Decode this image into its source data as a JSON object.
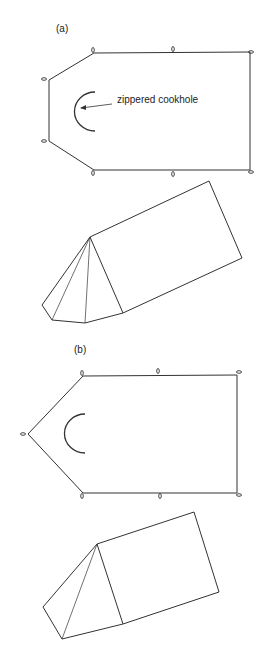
{
  "figures": [
    {
      "id": "a",
      "label": "(a)",
      "annotation": "zippered cookhole"
    },
    {
      "id": "b",
      "label": "(b)"
    }
  ],
  "colors": {
    "line": "#333333",
    "background": "#ffffff"
  }
}
